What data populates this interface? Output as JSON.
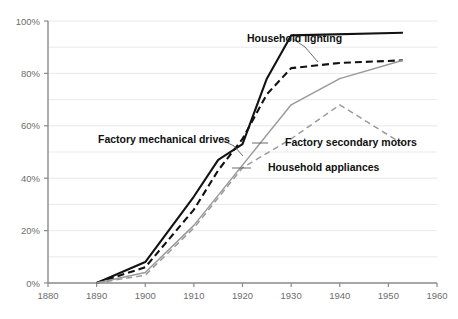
{
  "chart_data": {
    "type": "line",
    "title": "",
    "subtitle": "",
    "xlabel": "",
    "ylabel": "",
    "xlim": [
      1880,
      1960
    ],
    "ylim": [
      0,
      100
    ],
    "grid": true,
    "grid_detail": "horizontal gridlines every 10%, labeled ticks every 20%",
    "legend_position": "inline annotations with leader lines",
    "x_ticks": [
      1880,
      1890,
      1900,
      1910,
      1920,
      1930,
      1940,
      1950,
      1960
    ],
    "x_tick_labels": [
      "1880",
      "1890",
      "1900",
      "1910",
      "1920",
      "1930",
      "1940",
      "1950",
      "1960"
    ],
    "y_ticks": [
      0,
      20,
      40,
      60,
      80,
      100
    ],
    "y_tick_labels": [
      "0%",
      "20%",
      "40%",
      "60%",
      "80%",
      "100%"
    ],
    "series": [
      {
        "name": "Household lighting",
        "color": "#121212",
        "style": "solid",
        "width": 2.1,
        "label_x": 247,
        "label_y": 42,
        "leader": "M 293 39 L 305 47 L 318 62",
        "points": [
          {
            "x": 1890,
            "y": 0
          },
          {
            "x": 1900,
            "y": 8
          },
          {
            "x": 1910,
            "y": 33
          },
          {
            "x": 1915,
            "y": 47
          },
          {
            "x": 1920,
            "y": 53
          },
          {
            "x": 1925,
            "y": 78
          },
          {
            "x": 1930,
            "y": 94.5
          },
          {
            "x": 1953,
            "y": 95.5
          }
        ]
      },
      {
        "name": "Factory mechanical drives",
        "color": "#121212",
        "style": "dashed",
        "width": 2.1,
        "label_x": 98,
        "label_y": 143,
        "leader": "M 222 140 L 234 146 L 243 156",
        "points": [
          {
            "x": 1890,
            "y": 0
          },
          {
            "x": 1900,
            "y": 6
          },
          {
            "x": 1910,
            "y": 28
          },
          {
            "x": 1915,
            "y": 43
          },
          {
            "x": 1920,
            "y": 55
          },
          {
            "x": 1925,
            "y": 72
          },
          {
            "x": 1930,
            "y": 82
          },
          {
            "x": 1940,
            "y": 84
          },
          {
            "x": 1953,
            "y": 85
          }
        ]
      },
      {
        "name": "Factory secondary motors",
        "color": "#9a9a9a",
        "style": "solid",
        "width": 1.5,
        "label_x": 285,
        "label_y": 146,
        "leader": "M 252 143 L 268 143",
        "points": [
          {
            "x": 1890,
            "y": 0
          },
          {
            "x": 1900,
            "y": 4
          },
          {
            "x": 1910,
            "y": 22
          },
          {
            "x": 1920,
            "y": 45
          },
          {
            "x": 1930,
            "y": 68
          },
          {
            "x": 1940,
            "y": 78
          },
          {
            "x": 1953,
            "y": 85
          }
        ]
      },
      {
        "name": "Household appliances",
        "color": "#9a9a9a",
        "style": "dashed",
        "width": 1.5,
        "label_x": 268,
        "label_y": 171,
        "leader": "M 232 168 L 251 168",
        "points": [
          {
            "x": 1890,
            "y": 0
          },
          {
            "x": 1900,
            "y": 3
          },
          {
            "x": 1910,
            "y": 21
          },
          {
            "x": 1920,
            "y": 44
          },
          {
            "x": 1930,
            "y": 55
          },
          {
            "x": 1940,
            "y": 68
          },
          {
            "x": 1953,
            "y": 53
          }
        ]
      }
    ]
  },
  "axes": {
    "x_axis_name": "year-axis",
    "y_axis_name": "percent-axis"
  }
}
